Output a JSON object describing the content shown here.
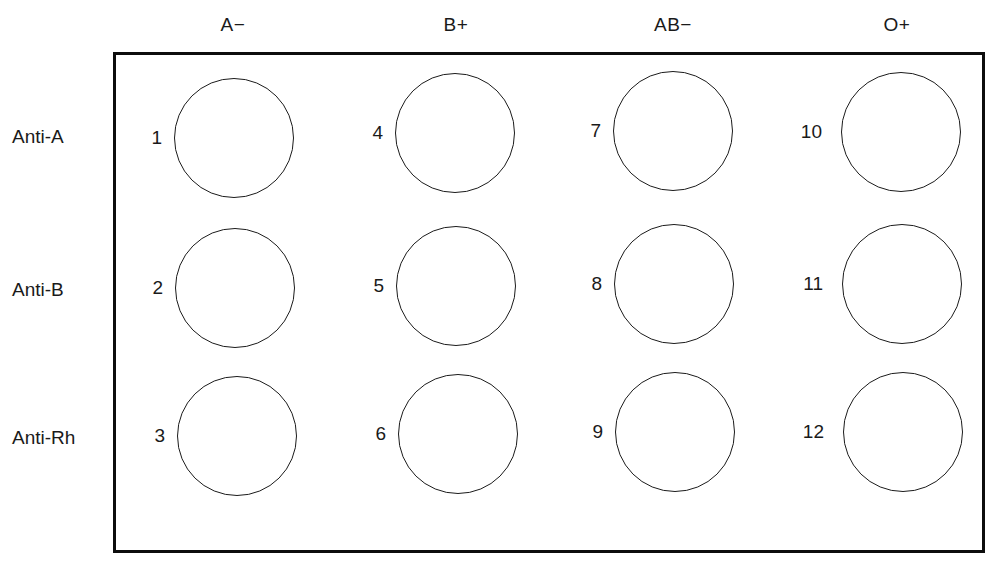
{
  "figure": {
    "background_color": "#ffffff",
    "ink_color": "#1a1a1a"
  },
  "columns": [
    {
      "label": "A−",
      "center_x": 233
    },
    {
      "label": "B+",
      "center_x": 456
    },
    {
      "label": "AB−",
      "center_x": 673
    },
    {
      "label": "O+",
      "center_x": 897
    }
  ],
  "rows": [
    {
      "label": "Anti-A",
      "label_top": 124,
      "well_top": 78
    },
    {
      "label": "Anti-B",
      "label_top": 277,
      "well_top": 230
    },
    {
      "label": "Anti-Rh",
      "label_top": 425,
      "well_top": 378
    }
  ],
  "wells": [
    {
      "number": "1",
      "row": "Anti-A",
      "column": "A−",
      "left": 174,
      "top": 78,
      "num_left": 128,
      "num_top": 125
    },
    {
      "number": "4",
      "row": "Anti-A",
      "column": "B+",
      "left": 395,
      "top": 73,
      "num_left": 349,
      "num_top": 120
    },
    {
      "number": "7",
      "row": "Anti-A",
      "column": "AB−",
      "left": 613,
      "top": 71,
      "num_left": 567,
      "num_top": 118
    },
    {
      "number": "10",
      "row": "Anti-A",
      "column": "O+",
      "left": 841,
      "top": 72,
      "num_left": 788,
      "num_top": 119
    },
    {
      "number": "2",
      "row": "Anti-B",
      "column": "A−",
      "left": 175,
      "top": 228,
      "num_left": 129,
      "num_top": 275
    },
    {
      "number": "5",
      "row": "Anti-B",
      "column": "B+",
      "left": 396,
      "top": 226,
      "num_left": 350,
      "num_top": 273
    },
    {
      "number": "8",
      "row": "Anti-B",
      "column": "AB−",
      "left": 614,
      "top": 224,
      "num_left": 568,
      "num_top": 271
    },
    {
      "number": "11",
      "row": "Anti-B",
      "column": "O+",
      "left": 842,
      "top": 224,
      "num_left": 789,
      "num_top": 271
    },
    {
      "number": "3",
      "row": "Anti-Rh",
      "column": "A−",
      "left": 177,
      "top": 376,
      "num_left": 131,
      "num_top": 423
    },
    {
      "number": "6",
      "row": "Anti-Rh",
      "column": "B+",
      "left": 398,
      "top": 374,
      "num_left": 352,
      "num_top": 421
    },
    {
      "number": "9",
      "row": "Anti-Rh",
      "column": "AB−",
      "left": 615,
      "top": 372,
      "num_left": 569,
      "num_top": 419
    },
    {
      "number": "12",
      "row": "Anti-Rh",
      "column": "O+",
      "left": 843,
      "top": 372,
      "num_left": 790,
      "num_top": 419
    }
  ]
}
